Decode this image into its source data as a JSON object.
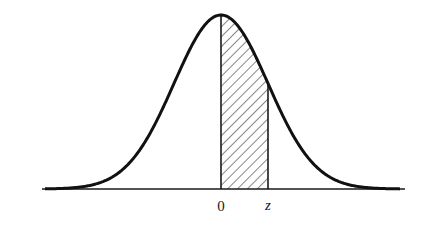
{
  "figure": {
    "labels": {
      "zero": "0",
      "z": "z"
    },
    "colors": {
      "curve": "#111111",
      "axis": "#1a1a1a",
      "hatch": "#222222",
      "background": "#ffffff"
    }
  },
  "chart_data": {
    "type": "area",
    "title": "",
    "xlabel": "",
    "ylabel": "",
    "curve": "standard normal density",
    "x_tick_labels": [
      "0",
      "z"
    ],
    "shaded_region": {
      "from": "0",
      "to": "z",
      "pattern": "diagonal hatch"
    },
    "z_value_in_sigma": 1.0,
    "axis_range_sigma": [
      -3.8,
      3.9
    ],
    "grid": false,
    "legend": null
  }
}
